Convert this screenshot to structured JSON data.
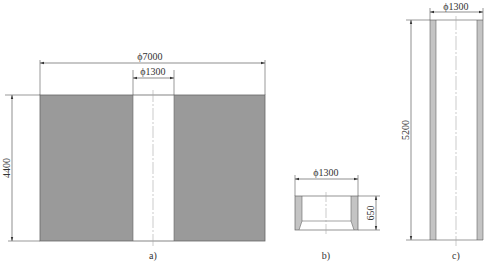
{
  "colors": {
    "fill": "#9a9a9a",
    "wall": "#c4c4c4",
    "line": "#444444",
    "center_line": "#aaaaaa"
  },
  "figures": {
    "a": {
      "caption": "a)",
      "outer_diameter": "ϕ7000",
      "inner_diameter": "ϕ1300",
      "height": "4400"
    },
    "b": {
      "caption": "b)",
      "diameter": "ϕ1300",
      "height": "650"
    },
    "c": {
      "caption": "c)",
      "diameter": "ϕ1300",
      "height": "5200"
    }
  }
}
